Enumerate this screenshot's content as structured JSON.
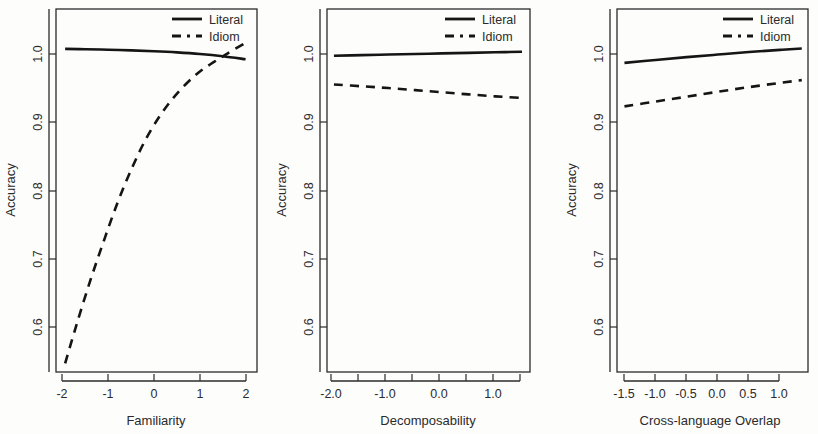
{
  "figure": {
    "background": "#fdfdfc",
    "panel_count": 3
  },
  "legend": {
    "literal_label": "Literal",
    "idiom_label": "Idiom"
  },
  "chart_data": [
    {
      "type": "line",
      "title": "",
      "xlabel": "Familiarity",
      "ylabel": "Accuracy",
      "xlim": [
        -2.35,
        2.05
      ],
      "ylim": [
        0.53,
        1.035
      ],
      "xticks": [
        -2,
        -1,
        0,
        1,
        2
      ],
      "xtick_labels": [
        "-2",
        "-1",
        "0",
        "1",
        "2"
      ],
      "yticks": [
        0.6,
        0.7,
        0.8,
        0.9,
        1.0
      ],
      "ytick_labels": [
        "0.6",
        "0.7",
        "0.8",
        "0.9",
        "1.0"
      ],
      "grid": false,
      "legend_position": "top-right",
      "series": [
        {
          "name": "Literal",
          "style": "solid",
          "color": "#151515",
          "x": [
            -2.15,
            -1.7,
            -1.2,
            -0.7,
            -0.2,
            0.3,
            0.8,
            1.3,
            1.8
          ],
          "values": [
            0.9795,
            0.979,
            0.9783,
            0.9774,
            0.9762,
            0.9746,
            0.9724,
            0.9693,
            0.9651
          ]
        },
        {
          "name": "Idiom",
          "style": "dashed",
          "color": "#151515",
          "x": [
            -2.15,
            -1.9,
            -1.6,
            -1.3,
            -1.0,
            -0.7,
            -0.4,
            -0.1,
            0.2,
            0.5,
            0.8,
            1.1,
            1.4,
            1.8
          ],
          "values": [
            0.542,
            0.596,
            0.657,
            0.713,
            0.766,
            0.812,
            0.852,
            0.884,
            0.91,
            0.931,
            0.948,
            0.961,
            0.973,
            0.988
          ]
        }
      ]
    },
    {
      "type": "line",
      "title": "",
      "xlabel": "Decomposability",
      "ylabel": "Accuracy",
      "xlim": [
        -2.05,
        1.75
      ],
      "ylim": [
        0.53,
        1.035
      ],
      "xticks": [
        -2.0,
        -1.5,
        -1.0,
        -0.5,
        0.0,
        0.5,
        1.0,
        1.5
      ],
      "xtick_labels": [
        "-2.0",
        "",
        "-1.0",
        "",
        "0.0",
        "",
        "1.0",
        ""
      ],
      "yticks": [
        0.6,
        0.7,
        0.8,
        0.9,
        1.0
      ],
      "ytick_labels": [
        "0.6",
        "0.7",
        "0.8",
        "0.9",
        "1.0"
      ],
      "grid": false,
      "legend_position": "top-right",
      "series": [
        {
          "name": "Literal",
          "style": "solid",
          "color": "#151515",
          "x": [
            -1.92,
            -1.4,
            -0.9,
            -0.4,
            0.1,
            0.6,
            1.1,
            1.6
          ],
          "values": [
            0.97,
            0.9708,
            0.9716,
            0.9724,
            0.9732,
            0.974,
            0.9748,
            0.9755
          ]
        },
        {
          "name": "Idiom",
          "style": "dashed",
          "color": "#151515",
          "x": [
            -1.92,
            -1.4,
            -0.9,
            -0.4,
            0.1,
            0.6,
            1.1,
            1.6
          ],
          "values": [
            0.93,
            0.9275,
            0.925,
            0.9222,
            0.9192,
            0.9162,
            0.9135,
            0.9112
          ]
        }
      ]
    },
    {
      "type": "line",
      "title": "",
      "xlabel": "Cross-language Overlap",
      "ylabel": "Accuracy",
      "xlim": [
        -1.72,
        1.35
      ],
      "ylim": [
        0.53,
        1.035
      ],
      "xticks": [
        -1.5,
        -1.0,
        -0.5,
        0.0,
        0.5,
        1.0
      ],
      "xtick_labels": [
        "-1.5",
        "-1.0",
        "-0.5",
        "0.0",
        "0.5",
        "1.0"
      ],
      "yticks": [
        0.6,
        0.7,
        0.8,
        0.9,
        1.0
      ],
      "ytick_labels": [
        "0.6",
        "0.7",
        "0.8",
        "0.9",
        "1.0"
      ],
      "grid": false,
      "legend_position": "top-right",
      "series": [
        {
          "name": "Literal",
          "style": "solid",
          "color": "#151515",
          "x": [
            -1.6,
            -1.1,
            -0.6,
            -0.1,
            0.4,
            0.9,
            1.25
          ],
          "values": [
            0.96,
            0.9641,
            0.968,
            0.9716,
            0.9751,
            0.9781,
            0.98
          ]
        },
        {
          "name": "Idiom",
          "style": "dashed",
          "color": "#151515",
          "x": [
            -1.6,
            -1.1,
            -0.6,
            -0.1,
            0.4,
            0.9,
            1.25
          ],
          "values": [
            0.8995,
            0.9063,
            0.913,
            0.9198,
            0.9263,
            0.9322,
            0.936
          ]
        }
      ]
    }
  ]
}
